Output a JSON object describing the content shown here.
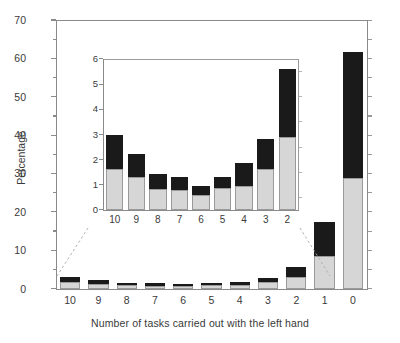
{
  "chart_data": {
    "type": "bar",
    "title": "",
    "xlabel": "Number of tasks carried out with the left hand",
    "ylabel": "Percentage",
    "ylim": [
      0,
      70
    ],
    "ytick_labels": [
      "0",
      "10",
      "20",
      "30",
      "40",
      "50",
      "60",
      "70"
    ],
    "ytick_values": [
      0,
      10,
      20,
      30,
      40,
      50,
      60,
      70
    ],
    "minor_tick_step": 5,
    "grid": false,
    "legend": "none",
    "stacked": true,
    "categories": [
      "10",
      "9",
      "8",
      "7",
      "6",
      "5",
      "4",
      "3",
      "2",
      "1",
      "0"
    ],
    "series": [
      {
        "name": "lower-segment",
        "color": "#d6d6d6",
        "values": [
          1.62,
          1.3,
          0.82,
          0.78,
          0.6,
          0.87,
          0.97,
          1.62,
          2.9,
          8.6,
          28.9
        ]
      },
      {
        "name": "upper-segment",
        "color": "#1a1a1a",
        "values": [
          1.35,
          0.92,
          0.63,
          0.55,
          0.37,
          0.44,
          0.88,
          1.22,
          2.7,
          8.8,
          32.8
        ]
      }
    ],
    "totals": [
      2.97,
      2.22,
      1.45,
      1.33,
      0.97,
      1.31,
      1.85,
      2.84,
      5.6,
      17.4,
      61.7
    ],
    "inset": {
      "type": "bar",
      "stacked": true,
      "ylim": [
        0,
        6
      ],
      "ytick_labels": [
        "0",
        "1",
        "2",
        "3",
        "4",
        "5",
        "6"
      ],
      "ytick_values": [
        0,
        1,
        2,
        3,
        4,
        5,
        6
      ],
      "categories": [
        "10",
        "9",
        "8",
        "7",
        "6",
        "5",
        "4",
        "3",
        "2"
      ],
      "series": [
        {
          "name": "lower-segment",
          "color": "#d6d6d6",
          "values": [
            1.62,
            1.3,
            0.82,
            0.78,
            0.6,
            0.87,
            0.97,
            1.62,
            2.9
          ]
        },
        {
          "name": "upper-segment",
          "color": "#1a1a1a",
          "values": [
            1.35,
            0.92,
            0.63,
            0.55,
            0.37,
            0.44,
            0.88,
            1.22,
            2.7
          ]
        }
      ],
      "totals": [
        2.97,
        2.22,
        1.45,
        1.33,
        0.97,
        1.31,
        1.85,
        2.84,
        5.6
      ]
    }
  },
  "colors": {
    "lower_segment": "#d6d6d6",
    "upper_segment": "#1a1a1a",
    "axis": "#8a8a8a",
    "text": "#3a3a3a",
    "background": "#ffffff"
  }
}
